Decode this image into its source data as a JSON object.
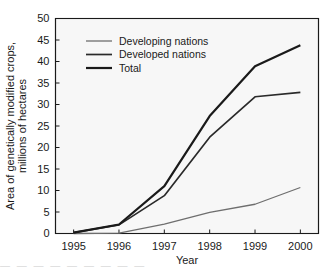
{
  "figure": {
    "background_color": "#ffffff",
    "plot_background_color": "#f7f7f7",
    "axis_color": "#1a1a1a"
  },
  "chart_data": {
    "type": "line",
    "title": "",
    "xlabel": "Year",
    "ylabel": "Area of genetically modified crops, millions of hectares",
    "categories": [
      "1995",
      "1996",
      "1997",
      "1998",
      "1999",
      "2000"
    ],
    "x": [
      1995,
      1996,
      1997,
      1998,
      1999,
      2000
    ],
    "xlim": [
      1994.6,
      2000.4
    ],
    "ylim": [
      0,
      50
    ],
    "yticks": [
      0,
      5,
      10,
      15,
      20,
      25,
      30,
      35,
      40,
      45,
      50
    ],
    "xticks": [
      1995,
      1996,
      1997,
      1998,
      1999,
      2000
    ],
    "grid": false,
    "legend_position": "upper-left-inside",
    "series": [
      {
        "name": "Developing nations",
        "values": [
          0,
          0.1,
          2.2,
          4.9,
          6.8,
          10.7
        ],
        "color": "#6e6e6e",
        "width": 1.3
      },
      {
        "name": "Developed nations",
        "values": [
          0.2,
          2.0,
          8.8,
          22.4,
          31.8,
          32.8
        ],
        "color": "#2a2a2a",
        "width": 1.7
      },
      {
        "name": "Total",
        "values": [
          0.2,
          2.1,
          11.0,
          27.3,
          38.9,
          43.8
        ],
        "color": "#1a1a1a",
        "width": 2.2
      }
    ]
  },
  "legend": {
    "items": [
      {
        "label": "Developing nations"
      },
      {
        "label": "Developed nations"
      },
      {
        "label": "Total"
      }
    ]
  },
  "footer": {
    "partial_text": "—  —  —   —   —    —    —   —  —"
  }
}
